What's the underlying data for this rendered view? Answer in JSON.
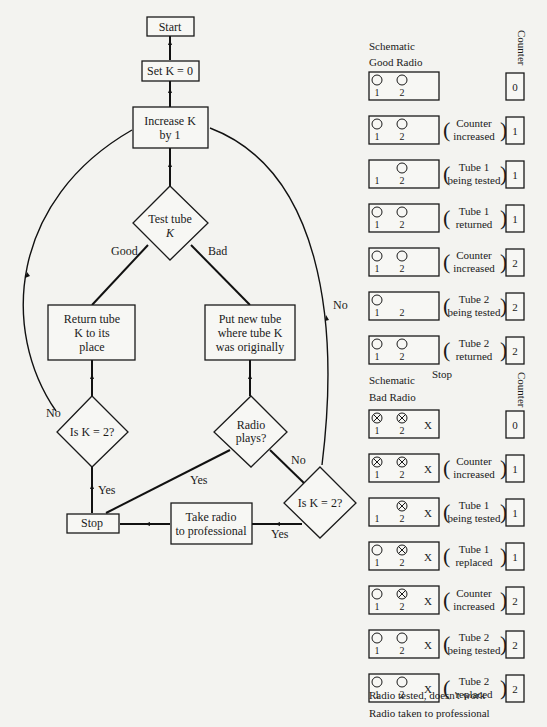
{
  "flowchart": {
    "start": "Start",
    "set_k": "Set K = 0",
    "increase_k": [
      "Increase K",
      "by 1"
    ],
    "test_tube": [
      "Test tube",
      "K"
    ],
    "good_label": "Good",
    "bad_label": "Bad",
    "return_tube": [
      "Return tube",
      "K to its",
      "place"
    ],
    "put_new_tube": [
      "Put new tube",
      "where tube K",
      "was originally"
    ],
    "is_k2_left": "Is K = 2?",
    "radio_plays": [
      "Radio",
      "plays?"
    ],
    "is_k2_right": "Is K = 2?",
    "no_left": "No",
    "no_right_loop": "No",
    "no_radio": "No",
    "yes_left": "Yes",
    "yes_radio": "Yes",
    "yes_right": "Yes",
    "stop": "Stop",
    "take_radio": [
      "Take radio",
      "to professional"
    ]
  },
  "good_radio": {
    "title": [
      "Schematic",
      "Good Radio"
    ],
    "counter_header": "Counter",
    "rows": [
      {
        "tube1": "ok",
        "tube2": "ok",
        "note": [],
        "counter": "0"
      },
      {
        "tube1": "ok",
        "tube2": "ok",
        "note": [
          "Counter",
          "increased"
        ],
        "counter": "1"
      },
      {
        "tube1": "none",
        "tube2": "ok",
        "note": [
          "Tube 1",
          "being tested"
        ],
        "counter": "1"
      },
      {
        "tube1": "ok",
        "tube2": "ok",
        "note": [
          "Tube 1",
          "returned"
        ],
        "counter": "1"
      },
      {
        "tube1": "ok",
        "tube2": "ok",
        "note": [
          "Counter",
          "increased"
        ],
        "counter": "2"
      },
      {
        "tube1": "ok",
        "tube2": "none",
        "note": [
          "Tube 2",
          "being tested"
        ],
        "counter": "2"
      },
      {
        "tube1": "ok",
        "tube2": "ok",
        "note": [
          "Tube 2",
          "returned"
        ],
        "counter": "2"
      }
    ],
    "footer": "Stop"
  },
  "bad_radio": {
    "title": [
      "Schematic",
      "Bad Radio"
    ],
    "counter_header": "Counter",
    "fault_mark": "X",
    "rows": [
      {
        "tube1": "bad",
        "tube2": "bad",
        "note": [],
        "counter": "0"
      },
      {
        "tube1": "bad",
        "tube2": "bad",
        "note": [
          "Counter",
          "increased"
        ],
        "counter": "1"
      },
      {
        "tube1": "none",
        "tube2": "bad",
        "note": [
          "Tube 1",
          "being tested"
        ],
        "counter": "1"
      },
      {
        "tube1": "ok",
        "tube2": "bad",
        "note": [
          "Tube 1",
          "replaced"
        ],
        "counter": "1"
      },
      {
        "tube1": "ok",
        "tube2": "bad",
        "note": [
          "Counter",
          "increased"
        ],
        "counter": "2"
      },
      {
        "tube1": "ok",
        "tube2": "ok",
        "note": [
          "Tube 2",
          "being tested"
        ],
        "counter": "2"
      },
      {
        "tube1": "ok",
        "tube2": "ok",
        "note": [
          "Tube 2",
          "replaced"
        ],
        "counter": "2"
      }
    ],
    "footer": [
      "Radio tested, doesn't work",
      "Radio taken to professional"
    ]
  },
  "tube_labels": [
    "1",
    "2"
  ]
}
